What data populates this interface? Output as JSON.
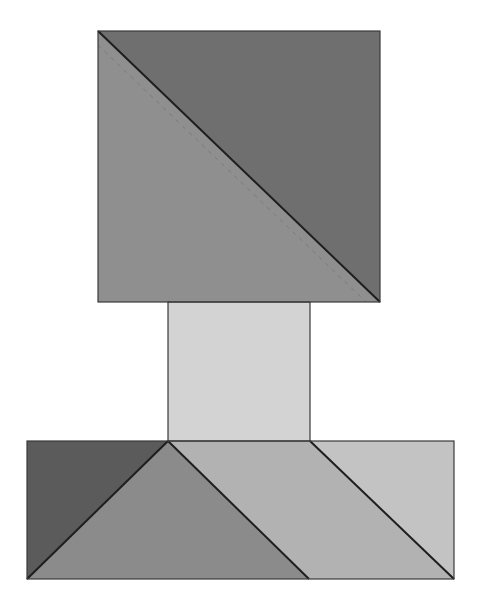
{
  "diagram": {
    "type": "quilt-block",
    "canvas": {
      "width": 481,
      "height": 609,
      "background": "#ffffff"
    },
    "stroke": "#1e1e1e",
    "shapes": [
      {
        "id": "top-square-upper-triangle",
        "points": "98,31 380,31 380,302",
        "fill": "#6f6f6f"
      },
      {
        "id": "top-square-lower-triangle",
        "points": "98,31 98,302 380,302",
        "fill": "#8f8f8f"
      },
      {
        "id": "middle-rectangle",
        "points": "168,302 310,302 310,441 168,441",
        "fill": "#d3d3d3"
      },
      {
        "id": "bottom-left-dark-triangle",
        "points": "27,441 168,441 27,579",
        "fill": "#5b5b5b"
      },
      {
        "id": "bottom-center-triangle",
        "points": "168,441 309,579 27,579",
        "fill": "#8b8b8b"
      },
      {
        "id": "bottom-parallelogram",
        "points": "168,441 310,441 454,579 309,579",
        "fill": "#b2b2b2"
      },
      {
        "id": "bottom-right-triangle",
        "points": "310,441 454,441 454,579",
        "fill": "#c3c3c3"
      }
    ],
    "lines": [
      {
        "id": "top-diagonal",
        "x1": 98,
        "y1": 31,
        "x2": 380,
        "y2": 302,
        "dashed": false
      },
      {
        "id": "top-seam-dashed",
        "x1": 98,
        "y1": 45,
        "x2": 366,
        "y2": 302,
        "dashed": true
      },
      {
        "id": "bottom-left-diagonal",
        "x1": 168,
        "y1": 441,
        "x2": 27,
        "y2": 579,
        "dashed": false
      },
      {
        "id": "bottom-center-diagonal",
        "x1": 168,
        "y1": 441,
        "x2": 309,
        "y2": 579,
        "dashed": false
      },
      {
        "id": "bottom-right-diagonal",
        "x1": 310,
        "y1": 441,
        "x2": 454,
        "y2": 579,
        "dashed": false
      }
    ],
    "outlines": [
      {
        "id": "top-square-outline",
        "x": 98,
        "y": 31,
        "w": 282,
        "h": 271
      },
      {
        "id": "middle-rectangle-outline",
        "x": 168,
        "y": 302,
        "w": 142,
        "h": 139
      },
      {
        "id": "bottom-rectangle-outline",
        "x": 27,
        "y": 441,
        "w": 427,
        "h": 138
      }
    ]
  }
}
